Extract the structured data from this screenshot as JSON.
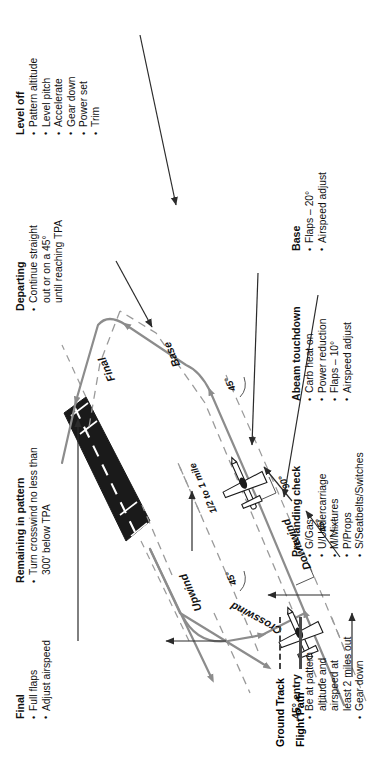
{
  "figure": {
    "orientation_note": "landscape figure shown rotated 90 degrees counter-clockwise"
  },
  "legend": {
    "items": [
      {
        "label": "Ground Track",
        "style": "dashed"
      },
      {
        "label": "Flight Path",
        "style": "solid"
      }
    ]
  },
  "callouts": [
    {
      "id": "final",
      "title": "Final",
      "items": [
        "Full flaps",
        "Adjust airspeed"
      ]
    },
    {
      "id": "remaining-in-pattern",
      "title": "Remaining in pattern",
      "items": [
        "Turn crosswind no less than\n300' below TPA"
      ]
    },
    {
      "id": "departing",
      "title": "Departing",
      "items": [
        "Continue straight\nout or on a 45°\nuntil reaching TPA"
      ]
    },
    {
      "id": "level-off",
      "title": "Level off",
      "items": [
        "Pattern altitude",
        "Level pitch",
        "Accelerate",
        "Gear down",
        "Power set",
        "Trim"
      ]
    },
    {
      "id": "base",
      "title": "Base",
      "items": [
        "Flaps – 20°",
        "Airspeed adjust"
      ]
    },
    {
      "id": "abeam-touchdown",
      "title": "Abeam touchdown",
      "items": [
        "Carb heat on",
        "Power reduction",
        "Flaps – 10°",
        "Airspeed adjust"
      ]
    },
    {
      "id": "pre-landing-check",
      "title": "Pre-landing check",
      "items": [
        "G/Gas",
        "U/Undercarriage",
        "M/Mixtures",
        "P/Props",
        "S/Seatbelts/Switches"
      ]
    },
    {
      "id": "entry-45",
      "title": "45° entry",
      "items": [
        "Be at pattern\naltitude and\nairspeed at\nleast 2 miles out",
        "Gear down"
      ]
    }
  ],
  "pattern_labels": {
    "final": "Final",
    "base": "Base",
    "downwind": "Downwind",
    "crosswind": "Crosswind",
    "upwind": "Upwind",
    "spacing": "1/2 to 1 mile",
    "angle_upwind": "45°",
    "angle_crosswind": "45°",
    "angle_downwind": "45°",
    "angle_base": "45°",
    "angle_abeam": "90°"
  },
  "colors": {
    "flight_path": "#8c8c8c",
    "ground_track": "#9a9a9a",
    "runway": "#1a1a1a",
    "leader": "#2b2b2b",
    "text": "#111111"
  }
}
